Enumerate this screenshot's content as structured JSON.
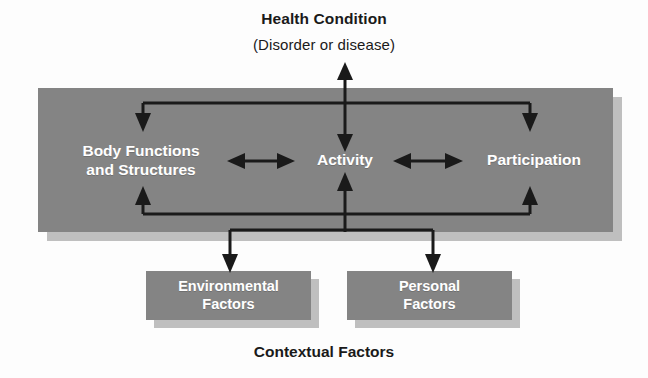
{
  "diagram": {
    "name": "ICF model of functioning and disability",
    "header": {
      "title": "Health Condition",
      "subtitle": "(Disorder or disease)"
    },
    "footer": {
      "label": "Contextual Factors"
    },
    "functioning_band": {
      "items": [
        {
          "id": "body-functions",
          "label": "Body Functions\nand Structures",
          "line1": "Body Functions",
          "line2": "and Structures"
        },
        {
          "id": "activity",
          "label": "Activity"
        },
        {
          "id": "participation",
          "label": "Participation"
        }
      ]
    },
    "contextual_boxes": [
      {
        "id": "environmental-factors",
        "line1": "Environmental",
        "line2": "Factors"
      },
      {
        "id": "personal-factors",
        "line1": "Personal",
        "line2": "Factors"
      }
    ],
    "connectors": [
      {
        "id": "health-to-activity",
        "from": "Health Condition",
        "to": "Activity",
        "direction": "bidirectional"
      },
      {
        "id": "health-to-body-functions",
        "from": "Health Condition",
        "to": "Body Functions and Structures",
        "direction": "down"
      },
      {
        "id": "health-to-participation",
        "from": "Health Condition",
        "to": "Participation",
        "direction": "down"
      },
      {
        "id": "body-functions-to-activity",
        "from": "Body Functions and Structures",
        "to": "Activity",
        "direction": "bidirectional"
      },
      {
        "id": "activity-to-participation",
        "from": "Activity",
        "to": "Participation",
        "direction": "bidirectional"
      },
      {
        "id": "contextual-to-body-functions",
        "from": "Contextual Factors",
        "to": "Body Functions and Structures",
        "direction": "up"
      },
      {
        "id": "contextual-to-activity",
        "from": "Contextual Factors",
        "to": "Activity",
        "direction": "up"
      },
      {
        "id": "contextual-to-participation",
        "from": "Contextual Factors",
        "to": "Participation",
        "direction": "up"
      },
      {
        "id": "band-to-environmental-factors",
        "from": "Functioning",
        "to": "Environmental Factors",
        "direction": "down"
      },
      {
        "id": "band-to-personal-factors",
        "from": "Functioning",
        "to": "Personal Factors",
        "direction": "down"
      }
    ],
    "colors": {
      "box_fill": "#848484",
      "box_shadow": "#bfbfbf",
      "box_text": "#ffffff",
      "page_text": "#1a1a1a",
      "connector": "#1a1a1a",
      "background": "#fdfdfd"
    }
  }
}
